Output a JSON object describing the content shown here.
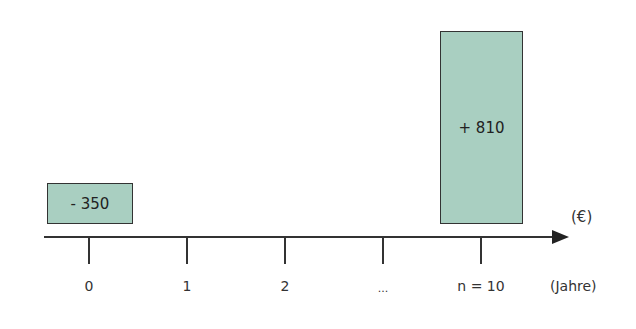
{
  "diagram": {
    "type": "cash-flow timeline",
    "boxes": [
      {
        "label": "- 350",
        "period": "0",
        "value": -350
      },
      {
        "label": "+ 810",
        "period": "n = 10",
        "value": 810
      }
    ],
    "ticks": [
      "0",
      "1",
      "2",
      "...",
      "n = 10"
    ],
    "y_unit": "(€)",
    "x_unit": "(Jahre)",
    "box_color": "#a9cfc1"
  }
}
